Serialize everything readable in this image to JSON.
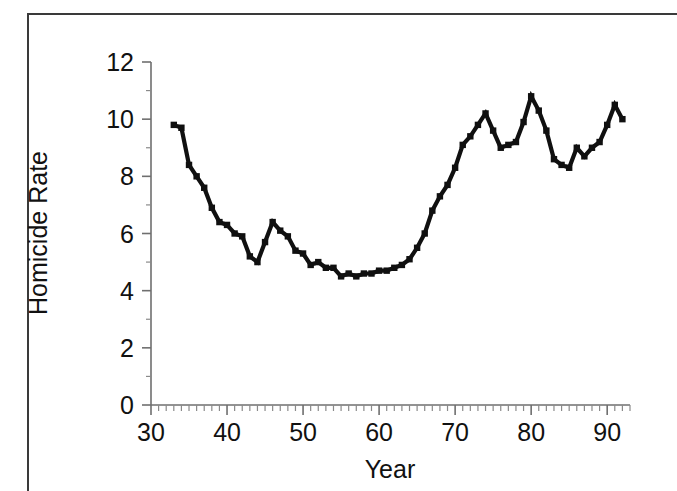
{
  "figure": {
    "background_color": "#ffffff",
    "frame_color": "#3a3a3a",
    "axis_color": "#6f6f6f",
    "series_color": "#101010"
  },
  "chart_data": {
    "type": "line",
    "title": "",
    "xlabel": "Year",
    "ylabel": "Homicide Rate",
    "xlim": [
      30,
      93
    ],
    "ylim": [
      0,
      12
    ],
    "grid": false,
    "legend": "none",
    "x_major_ticks": [
      30,
      40,
      50,
      60,
      70,
      80,
      90
    ],
    "x_major_tick_labels": [
      "30",
      "40",
      "50",
      "60",
      "70",
      "80",
      "90"
    ],
    "x_minor_tick_step": 1,
    "y_major_ticks": [
      0,
      2,
      4,
      6,
      8,
      10,
      12
    ],
    "y_major_tick_labels": [
      "0",
      "2",
      "4",
      "6",
      "8",
      "10",
      "12"
    ],
    "y_minor_tick_step": 1,
    "marker": "square",
    "series": [
      {
        "name": "Homicide Rate",
        "x": [
          33,
          34,
          35,
          36,
          37,
          38,
          39,
          40,
          41,
          42,
          43,
          44,
          45,
          46,
          47,
          48,
          49,
          50,
          51,
          52,
          53,
          54,
          55,
          56,
          57,
          58,
          59,
          60,
          61,
          62,
          63,
          64,
          65,
          66,
          67,
          68,
          69,
          70,
          71,
          72,
          73,
          74,
          75,
          76,
          77,
          78,
          79,
          80,
          81,
          82,
          83,
          84,
          85,
          86,
          87,
          88,
          89,
          90,
          91,
          92
        ],
        "values": [
          9.8,
          9.7,
          8.4,
          8.0,
          7.6,
          6.9,
          6.4,
          6.3,
          6.0,
          5.9,
          5.2,
          5.0,
          5.7,
          6.4,
          6.1,
          5.9,
          5.4,
          5.3,
          4.9,
          5.0,
          4.8,
          4.8,
          4.5,
          4.6,
          4.5,
          4.6,
          4.6,
          4.7,
          4.7,
          4.8,
          4.9,
          5.1,
          5.5,
          6.0,
          6.8,
          7.3,
          7.7,
          8.3,
          9.1,
          9.4,
          9.8,
          10.2,
          9.6,
          9.0,
          9.1,
          9.2,
          9.9,
          10.8,
          10.3,
          9.6,
          8.6,
          8.4,
          8.3,
          9.0,
          8.7,
          9.0,
          9.2,
          9.8,
          10.5,
          10.0
        ]
      }
    ]
  },
  "labels": {
    "x_axis_title": "Year",
    "y_axis_title": "Homicide Rate"
  }
}
